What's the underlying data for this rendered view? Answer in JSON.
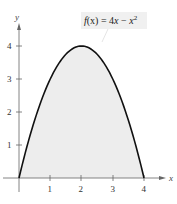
{
  "chart_data": {
    "type": "area",
    "title": "",
    "function_label": "f(x) = 4x − x²",
    "function_label_parts": {
      "prefix": "f",
      "arg": "(x)",
      "eq": " = 4",
      "x1": "x",
      "minus": " − ",
      "x2": "x",
      "exp": "2"
    },
    "xlabel": "x",
    "ylabel": "y",
    "x_ticks": [
      "1",
      "2",
      "3",
      "4"
    ],
    "y_ticks": [
      "1",
      "2",
      "3",
      "4"
    ],
    "xlim": [
      0,
      4
    ],
    "ylim": [
      0,
      4
    ],
    "grid": false,
    "shaded_region": "area under curve from x=0 to x=4",
    "x": [
      0,
      0.5,
      1,
      1.5,
      2,
      2.5,
      3,
      3.5,
      4
    ],
    "series": [
      {
        "name": "f(x) = 4x − x²",
        "values": [
          0,
          1.75,
          3,
          3.75,
          4,
          3.75,
          3,
          1.75,
          0
        ]
      }
    ],
    "colors": {
      "curve": "#111111",
      "fill": "#eeeeee",
      "axis": "#555555",
      "label_bg": "#f0f0f0"
    }
  }
}
